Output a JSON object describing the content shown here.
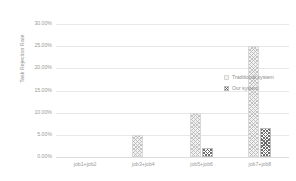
{
  "chart_data": {
    "type": "bar",
    "title": "",
    "xlabel": "",
    "ylabel": "Task Rejection Rate",
    "categories": [
      "job1+job2",
      "job3+job4",
      "job5+job6",
      "job7+job8"
    ],
    "series": [
      {
        "name": "Traditional system",
        "values": [
          0.0,
          5.0,
          10.0,
          25.0
        ]
      },
      {
        "name": "Our system",
        "values": [
          0.0,
          0.0,
          2.0,
          6.5
        ]
      }
    ],
    "ylim": [
      0,
      30
    ],
    "yticks": [
      0,
      5,
      10,
      15,
      20,
      25,
      30
    ],
    "ytick_labels": [
      "0.00%",
      "5.00%",
      "10.00%",
      "15.00%",
      "20.00%",
      "25.00%",
      "30.00%"
    ],
    "grid": true,
    "legend_position": "right"
  },
  "colors": {
    "background": "#ffffff",
    "gridline": "#e8e8e8",
    "axis_text": "#9a9a9a",
    "label_text": "#8c8c8c",
    "series_traditional": "#f2f2f2",
    "series_ours": "#5f5f5f"
  }
}
